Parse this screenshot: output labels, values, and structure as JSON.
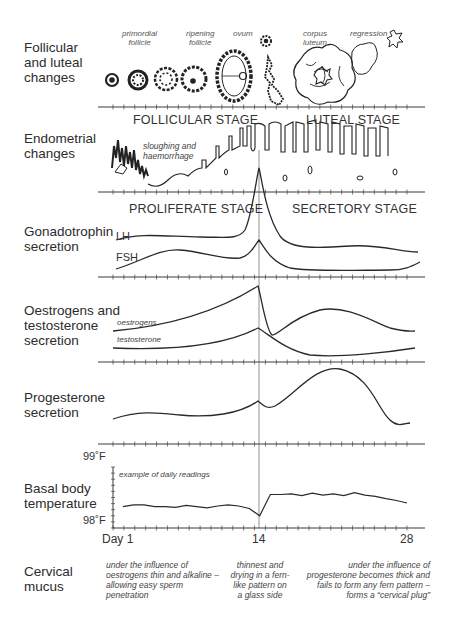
{
  "rows": {
    "follicular": {
      "line1": "Follicular",
      "line2": "and luteal",
      "line3": "changes"
    },
    "endometrial": {
      "line1": "Endometrial",
      "line2": "changes"
    },
    "gonadotrophin": {
      "line1": "Gonadotrophin",
      "line2": "secretion"
    },
    "oestrogens": {
      "line1": "Oestrogens and",
      "line2": "testosterone",
      "line3": "secretion"
    },
    "progesterone": {
      "line1": "Progesterone",
      "line2": "secretion"
    },
    "bbt": {
      "line1": "Basal body",
      "line2": "temperature"
    },
    "mucus": {
      "line1": "Cervical",
      "line2": "mucus"
    }
  },
  "follicle_captions": {
    "primordial": {
      "line1": "primordial",
      "line2": "follicle"
    },
    "ripening": {
      "line1": "ripening",
      "line2": "follicle"
    },
    "ovum": "ovum",
    "corpus": {
      "line1": "corpus",
      "line2": "luteum"
    },
    "regression": "regression"
  },
  "stages": {
    "follicular": "FOLLICULAR STAGE",
    "luteal": "LUTEAL STAGE",
    "proliferate": "PROLIFERATE STAGE",
    "secretory": "SECRETORY STAGE"
  },
  "annotations": {
    "sloughing": {
      "line1": "sloughing and",
      "line2": "haemorrhage"
    },
    "oestrogens_curve": "oestrogens",
    "testosterone_curve": "testosterone",
    "daily_readings": "example of daily readings"
  },
  "curve_labels": {
    "lh": "LH",
    "fsh": "FSH"
  },
  "temperature_axis": {
    "top": "99˚F",
    "bottom": "98˚F"
  },
  "day_axis": {
    "start": "Day 1",
    "mid": "14",
    "end": "28"
  },
  "mucus_notes": {
    "early": {
      "l1": "under the influence of",
      "l2": "oestrogens thin and alkaline –",
      "l3": "allowing easy sperm",
      "l4": "penetration"
    },
    "mid": {
      "l1": "thinnest and",
      "l2": "drying in a fern-",
      "l3": "like pattern on",
      "l4": "a glass side"
    },
    "late": {
      "l1": "under the influence of",
      "l2": "progesterone becomes thick and",
      "l3": "fails to form any fern pattern –",
      "l4": "forms a “cervical plug”"
    }
  },
  "chart_data": {
    "type": "line",
    "xlabel": "Day",
    "x_ticks": [
      "Day 1",
      "14",
      "28"
    ],
    "x": [
      1,
      2,
      3,
      4,
      5,
      6,
      7,
      8,
      9,
      10,
      11,
      12,
      13,
      14,
      15,
      16,
      17,
      18,
      19,
      20,
      21,
      22,
      23,
      24,
      25,
      26,
      27,
      28
    ],
    "bbt_series": {
      "name": "Basal body temperature (°F)",
      "ylim": [
        98.0,
        99.0
      ],
      "values": [
        98.35,
        98.38,
        98.38,
        98.35,
        98.35,
        98.34,
        98.37,
        98.35,
        98.33,
        98.36,
        98.38,
        98.36,
        98.32,
        98.2,
        98.55,
        98.55,
        98.56,
        98.53,
        98.57,
        98.54,
        98.56,
        98.53,
        98.58,
        98.54,
        98.52,
        98.48,
        98.45,
        98.41
      ]
    },
    "qualitative_series": [
      {
        "name": "LH",
        "shape": "low plateau, sharp surge peaking at day 14, falls to low level, small bump mid-luteal"
      },
      {
        "name": "FSH",
        "shape": "early rise, dip before day 14, small peak at day 14, low in luteal, rises near day 28"
      },
      {
        "name": "oestrogens",
        "shape": "rises to peak at day 14, sharp fall, second broad peak around day 22"
      },
      {
        "name": "testosterone",
        "shape": "low, small peak at day 14, low through luteal phase"
      },
      {
        "name": "progesterone",
        "shape": "low until day 14, small notch, broad peak ~day 22, falls by day 28"
      }
    ]
  }
}
